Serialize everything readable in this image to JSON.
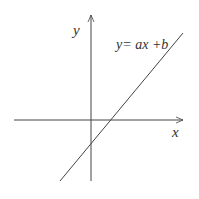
{
  "diagram": {
    "x_axis_label": "x",
    "y_axis_label": "y",
    "line_equation": "y= ax +b",
    "line_color": "#444444",
    "axis_color": "#444444"
  }
}
